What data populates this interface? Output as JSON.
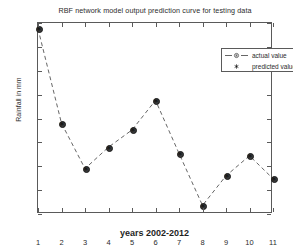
{
  "chart_data": {
    "type": "line",
    "title": "RBF network model output prediction curve for testing data",
    "xlabel": "years 2002-2012",
    "ylabel": "Rainfall in mm",
    "xlim": [
      1,
      11
    ],
    "ylim": [
      50,
      450
    ],
    "grid": false,
    "legend_position": "top-right",
    "x": [
      1,
      2,
      3,
      4,
      5,
      6,
      7,
      8,
      9,
      10,
      11
    ],
    "xticklabels": [
      "1",
      "2",
      "3",
      "4",
      "5",
      "6",
      "7",
      "8",
      "9",
      "10",
      "11"
    ],
    "yticklabels": [
      "50",
      "100",
      "150",
      "200",
      "250",
      "300",
      "350",
      "400",
      "450"
    ],
    "yticks": [
      50,
      100,
      150,
      200,
      250,
      300,
      350,
      400,
      450
    ],
    "series": [
      {
        "name": "actual value",
        "style": "dashed-line-circle",
        "color": "#555555",
        "values": [
          438,
          240,
          145,
          190,
          226,
          288,
          177,
          68,
          130,
          172,
          124
        ]
      },
      {
        "name": "predicted value",
        "style": "star-marker",
        "color": "#111111",
        "values": [
          438,
          240,
          145,
          190,
          226,
          288,
          177,
          68,
          130,
          172,
          124
        ]
      }
    ]
  },
  "legend": {
    "actual_label": "actual value",
    "predicted_label": "predicted value"
  },
  "colors": {
    "axis": "#5a5a5a",
    "line": "#555555",
    "marker": "#3a3a3a",
    "text": "#2b2b2b",
    "background": "#ffffff"
  }
}
